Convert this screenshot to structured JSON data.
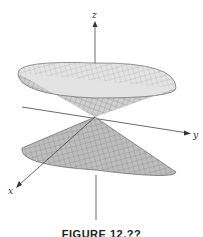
{
  "figure": {
    "type": "3d-surface",
    "surface": "double cone",
    "axes": {
      "x_label": "x",
      "y_label": "y",
      "z_label": "z"
    },
    "caption": "FIGURE 12.??",
    "colors": {
      "background": "#ffffff",
      "surface_fill": "#bdbdbd",
      "upper_inner_fill": "#d9d9d9",
      "mesh": "#6e6e6e",
      "axis": "#444444"
    }
  }
}
